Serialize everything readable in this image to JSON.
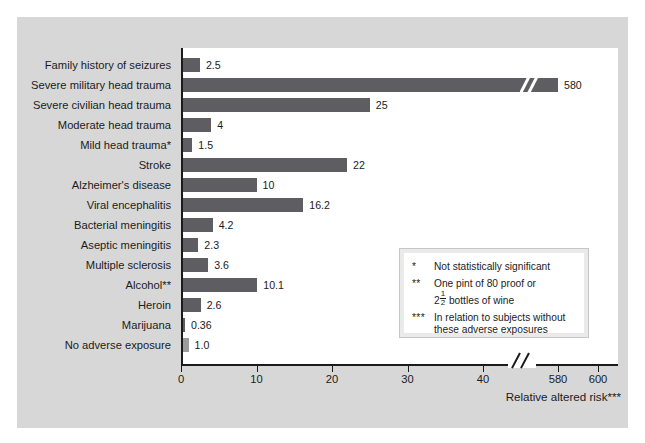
{
  "chart_data": {
    "type": "bar",
    "orientation": "horizontal",
    "title": "",
    "xlabel": "Relative altered risk***",
    "ylabel": "",
    "xlim": [
      0,
      600
    ],
    "grid": false,
    "legend_position": "inside-bottom-right",
    "axis_break": {
      "after": 44,
      "before": 570,
      "label": "//"
    },
    "xticks": [
      {
        "label": "0",
        "value": 0
      },
      {
        "label": "10",
        "value": 10
      },
      {
        "label": "20",
        "value": 20
      },
      {
        "label": "30",
        "value": 30
      },
      {
        "label": "40",
        "value": 40
      },
      {
        "label": "580",
        "value": 580
      },
      {
        "label": "600",
        "value": 600
      }
    ],
    "categories": [
      "Family history of seizures",
      "Severe military head trauma",
      "Severe civilian head trauma",
      "Moderate head trauma",
      "Mild head trauma*",
      "Stroke",
      "Alzheimer's disease",
      "Viral encephalitis",
      "Bacterial meningitis",
      "Aseptic meningitis",
      "Multiple sclerosis",
      "Alcohol**",
      "Heroin",
      "Marijuana",
      "No adverse exposure"
    ],
    "values": [
      2.5,
      580,
      25,
      4,
      1.5,
      22,
      10,
      16.2,
      4.2,
      2.3,
      3.6,
      10.1,
      2.6,
      0.36,
      1.0
    ],
    "value_labels": [
      "2.5",
      "580",
      "25",
      "4",
      "1.5",
      "22",
      "10",
      "16.2",
      "4.2",
      "2.3",
      "3.6",
      "10.1",
      "2.6",
      "0.36",
      "1.0"
    ],
    "bar_colors": [
      "#5d5d62",
      "#5d5d62",
      "#5d5d62",
      "#5d5d62",
      "#5d5d62",
      "#5d5d62",
      "#5d5d62",
      "#5d5d62",
      "#5d5d62",
      "#5d5d62",
      "#5d5d62",
      "#5d5d62",
      "#5d5d62",
      "#5d5d62",
      "#9c9c9c"
    ],
    "broken_bar_index": 1
  },
  "legend": {
    "notes": [
      {
        "marker": "*",
        "lines": [
          "Not statistically significant"
        ]
      },
      {
        "marker": "**",
        "lines": [
          "One pint of 80 proof or",
          "2<FRAC> bottles of wine"
        ],
        "fraction": {
          "whole": "2",
          "num": "1",
          "den": "2"
        }
      },
      {
        "marker": "***",
        "lines": [
          "In relation to subjects without",
          "these adverse exposures"
        ]
      }
    ]
  },
  "colors": {
    "panel_background": "#d7d7d7",
    "plot_background": "#ffffff",
    "bar_primary": "#5d5d62",
    "bar_reference": "#9c9c9c",
    "axis": "#1b1b1b",
    "text": "#1b1b1b",
    "legend_border": "#eaeaea"
  }
}
